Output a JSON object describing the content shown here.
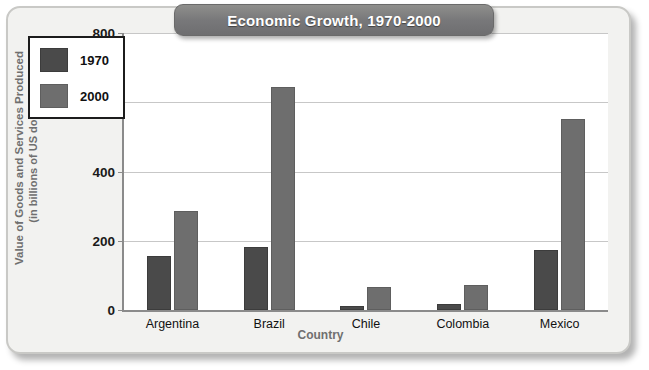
{
  "chart_data": {
    "type": "bar",
    "title": "Economic Growth, 1970-2000",
    "xlabel": "Country",
    "ylabel": "Value of Goods and Services Produced",
    "ylabel_line2": "(in billions of US dollars)",
    "categories": [
      "Argentina",
      "Brazil",
      "Chile",
      "Colombia",
      "Mexico"
    ],
    "series": [
      {
        "name": "1970",
        "color": "#4a4a4a",
        "values": [
          155,
          182,
          12,
          16,
          172
        ]
      },
      {
        "name": "2000",
        "color": "#6e6e6e",
        "values": [
          285,
          645,
          67,
          72,
          553
        ]
      }
    ],
    "ylim": [
      0,
      800
    ],
    "yticks": [
      0,
      200,
      400,
      600,
      800
    ],
    "ytick_labels": [
      "0",
      "200",
      "400",
      "600",
      "800"
    ],
    "grid": true,
    "legend_position": "upper-left-inside"
  },
  "colors": {
    "frame_background": "#f2f2f0",
    "frame_border": "#c9c9c6",
    "plot_background": "#ffffff",
    "axis": "#8b8b8b",
    "gridline": "#c7c7c7",
    "title_banner": "#78787a",
    "title_text": "#ffffff",
    "axis_title_text": "#6f6f6f",
    "tick_text": "#1a1a1a"
  }
}
